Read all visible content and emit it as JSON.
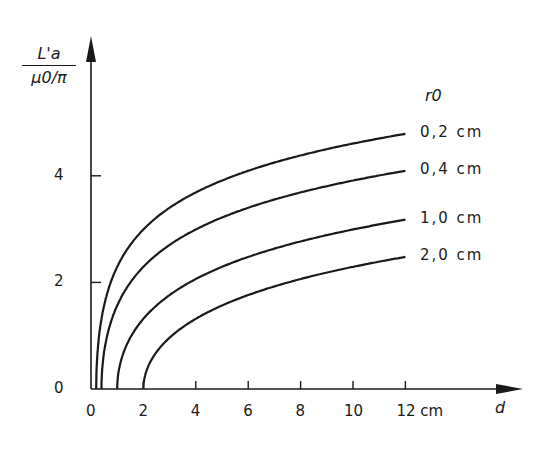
{
  "chart_data": {
    "type": "line",
    "title": "",
    "ylabel_numerator": "L'a",
    "ylabel_denominator": "μ0/π",
    "xlabel": "d",
    "x_unit": "cm",
    "legend_title": "r0",
    "xlim": [
      0,
      12
    ],
    "ylim": [
      0,
      5.5
    ],
    "x_ticks": [
      0,
      2,
      4,
      6,
      8,
      10,
      12
    ],
    "x_tick_labels": [
      "0",
      "2",
      "4",
      "6",
      "8",
      "10",
      "12 cm"
    ],
    "y_ticks": [
      0,
      2,
      4
    ],
    "y_tick_labels": [
      "0",
      "2",
      "4"
    ],
    "grid": false,
    "legend_position": "right, at curve ends",
    "series": [
      {
        "name": "0,2 cm",
        "r0": 0.2,
        "x": [
          0.2,
          0.3,
          0.5,
          1,
          2,
          3,
          4,
          6,
          8,
          10,
          12
        ],
        "y": [
          0.0,
          0.96,
          1.57,
          2.29,
          2.99,
          3.4,
          3.69,
          4.09,
          4.38,
          4.61,
          4.79
        ]
      },
      {
        "name": "0,4 cm",
        "r0": 0.4,
        "x": [
          0.4,
          0.5,
          0.7,
          1,
          2,
          3,
          4,
          6,
          8,
          10,
          12
        ],
        "y": [
          0.0,
          0.69,
          1.16,
          1.57,
          2.29,
          2.7,
          2.99,
          3.4,
          3.69,
          3.91,
          4.09
        ]
      },
      {
        "name": "1,0 cm",
        "r0": 1.0,
        "x": [
          1.0,
          1.2,
          1.5,
          2,
          3,
          4,
          6,
          8,
          10,
          12
        ],
        "y": [
          0.0,
          0.62,
          0.96,
          1.32,
          1.76,
          2.06,
          2.48,
          2.77,
          2.99,
          3.18
        ]
      },
      {
        "name": "2,0 cm",
        "r0": 2.0,
        "x": [
          2.0,
          2.5,
          3,
          4,
          5,
          6,
          8,
          10,
          12
        ],
        "y": [
          0.0,
          0.69,
          0.96,
          1.32,
          1.57,
          1.76,
          2.06,
          2.29,
          2.48
        ]
      }
    ]
  }
}
